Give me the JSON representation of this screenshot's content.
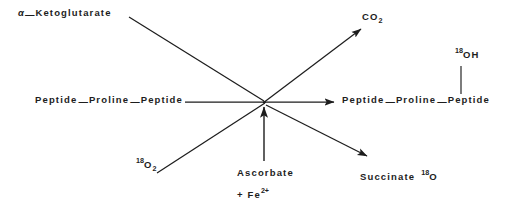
{
  "figure": {
    "type": "biochemical-reaction-scheme",
    "reaction_name": "prolyl hydroxylase reaction with oxygen-18 labeling",
    "stroke_color": "#1d1d1d",
    "background_color": "#ffffff"
  },
  "labels": {
    "ketoglutarate": {
      "alpha": "α",
      "dash": "—",
      "name": "Ketoglutarate"
    },
    "co2": {
      "text": "CO",
      "subscript": "2"
    },
    "substrate": {
      "part1": "Peptide",
      "dash1": "—",
      "part2": "Proline",
      "dash2": "—",
      "part3": "Peptide"
    },
    "product": {
      "part1": "Peptide",
      "dash1": "—",
      "part2": "Proline",
      "dash2": "—",
      "part3": "Peptide"
    },
    "hydroxyl": {
      "isotope": "18",
      "text": "OH"
    },
    "oxygen": {
      "isotope": "18",
      "element": "O",
      "subscript": "2"
    },
    "ascorbate": {
      "text": "Ascorbate"
    },
    "iron": {
      "plus": "+ Fe",
      "charge": "2+"
    },
    "succinate": {
      "text": "Succinate",
      "isotope": "18",
      "element": "O"
    }
  },
  "arrows": {
    "ketoglutarate_in": {
      "label": "alpha-ketoglutarate enters reaction"
    },
    "oxygen_in": {
      "label": "oxygen-18 enters reaction"
    },
    "substrate_in": {
      "label": "peptidyl proline enters reaction"
    },
    "cofactor_in": {
      "label": "ascorbate and ferrous iron cofactor"
    },
    "co2_out": {
      "label": "carbon dioxide released"
    },
    "product_out": {
      "label": "hydroxylated peptide produced"
    },
    "succinate_out": {
      "label": "succinate released"
    }
  }
}
